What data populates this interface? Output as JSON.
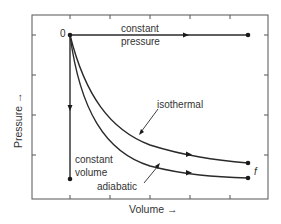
{
  "diagram": {
    "title": "",
    "axes": {
      "x_label": "Volume →",
      "y_label": "Pressure →"
    },
    "points": {
      "initial_label": "0",
      "final_label": "f"
    },
    "processes": [
      {
        "id": "constant-pressure",
        "label_line1": "constant",
        "label_line2": "pressure"
      },
      {
        "id": "isothermal",
        "label": "isothermal"
      },
      {
        "id": "adiabatic",
        "label": "adiabatic"
      },
      {
        "id": "constant-volume",
        "label_line1": "constant",
        "label_line2": "volume"
      }
    ],
    "colors": {
      "line": "#2a2a2a",
      "frame": "#555555",
      "text": "#333333",
      "background": "#ffffff"
    }
  }
}
